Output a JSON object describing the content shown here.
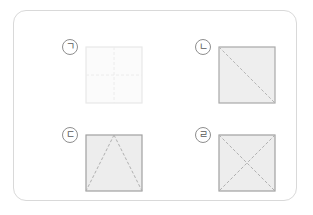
{
  "figure": {
    "title": "",
    "frame": {
      "border_color": "#d9d9d9",
      "background": "#ffffff",
      "corner_radius": 13
    },
    "cells": [
      {
        "id": "a",
        "label": "ㄱ",
        "label_name": "label-giyeok",
        "pattern": "cross-lines",
        "description": "square with dashed vertical and horizontal center lines",
        "fill": "#fbfbfb",
        "stroke": "#e8e8e8",
        "dash_color": "#ececec",
        "lines": [
          {
            "name": "vertical-center-line",
            "x1": 28,
            "y1": 0,
            "x2": 28,
            "y2": 56
          },
          {
            "name": "horizontal-center-line",
            "x1": 0,
            "y1": 28,
            "x2": 56,
            "y2": 28
          }
        ]
      },
      {
        "id": "b",
        "label": "ㄴ",
        "label_name": "label-nieun",
        "pattern": "one-diagonal",
        "description": "square with one dashed diagonal from top-left to bottom-right",
        "fill": "#eeeeee",
        "stroke": "#a8a8a8",
        "dash_color": "#b5b5b5",
        "lines": [
          {
            "name": "diagonal-tl-br",
            "x1": 0,
            "y1": 0,
            "x2": 56,
            "y2": 56
          }
        ]
      },
      {
        "id": "c",
        "label": "ㄷ",
        "label_name": "label-digeut",
        "pattern": "triangle",
        "description": "square with dashed triangle from top-center to both bottom corners",
        "fill": "#ededed",
        "stroke": "#a0a0a0",
        "dash_color": "#b0b0b0",
        "lines": [
          {
            "name": "triangle-left-leg",
            "x1": 28,
            "y1": 0,
            "x2": 0,
            "y2": 56
          },
          {
            "name": "triangle-right-leg",
            "x1": 28,
            "y1": 0,
            "x2": 56,
            "y2": 56
          }
        ]
      },
      {
        "id": "d",
        "label": "ㄹ",
        "label_name": "label-rieul",
        "pattern": "two-diagonals",
        "description": "square with both dashed diagonals forming an X",
        "fill": "#ededed",
        "stroke": "#a0a0a0",
        "dash_color": "#b0b0b0",
        "lines": [
          {
            "name": "diagonal-tl-br",
            "x1": 0,
            "y1": 0,
            "x2": 56,
            "y2": 56
          },
          {
            "name": "diagonal-tr-bl",
            "x1": 56,
            "y1": 0,
            "x2": 0,
            "y2": 56
          }
        ]
      }
    ],
    "square_size": 56,
    "dash_pattern": "3 2"
  }
}
